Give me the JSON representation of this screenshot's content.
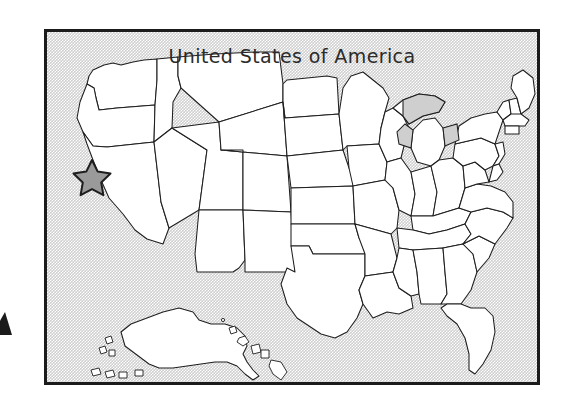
{
  "page": {
    "background_color": "#ffffff",
    "width": 569,
    "height": 408
  },
  "map_panel": {
    "title": "United States of America",
    "frame_color": "#1b1b1b",
    "ocean_color": "#cfcfcf",
    "land_color": "#ffffff",
    "border_color": "#1e1e1e",
    "frame": {
      "x": 44,
      "y": 29,
      "width": 496,
      "height": 356
    }
  },
  "marker": {
    "shape": "star",
    "fill_color": "#9a9a9a",
    "outline_color": "#1e1e1e",
    "location_description": "Pacific Northwest coast",
    "position": {
      "x": 89,
      "y": 143
    },
    "size": 32
  },
  "insets": [
    {
      "name": "alaska"
    },
    {
      "name": "hawaii"
    }
  ],
  "edge_glyph": {
    "name": "cropped-arrow",
    "color": "#1b1b1b"
  }
}
